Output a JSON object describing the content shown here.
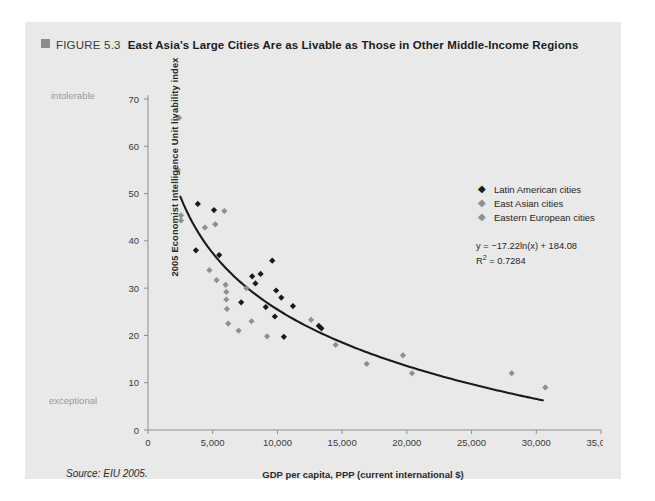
{
  "figure": {
    "marker_color": "#8d8d8d",
    "label": "FIGURE 5.3",
    "title": "East Asia's Large Cities Are as Livable as Those in Other Middle-Income Regions",
    "source": "Source: EIU 2005."
  },
  "legend": {
    "items": [
      {
        "label": "Latin American cities",
        "marker": "◆",
        "color": "#1a1a1a"
      },
      {
        "label": "East Asian cities",
        "marker": "◆",
        "color": "#8f8f8f"
      },
      {
        "label": "Eastern European cities",
        "marker": "◆",
        "color": "#8f8f8f"
      }
    ]
  },
  "annotations": {
    "equation": "y = −17.22ln(x) + 184.08",
    "r_squared_prefix": "R",
    "r_squared_exp": "2",
    "r_squared_value": " = 0.7284",
    "y_top_note": "intolerable",
    "y_bottom_note": "exceptional"
  },
  "chart_data": {
    "type": "scatter",
    "title": "East Asia's Large Cities Are as Livable as Those in Other Middle-Income Regions",
    "xlabel": "GDP per capita, PPP (current international $)",
    "ylabel": "2005 Economist Intelligence Unit livability index",
    "xlim": [
      0,
      35000
    ],
    "ylim": [
      0,
      70
    ],
    "xticks": [
      0,
      5000,
      10000,
      15000,
      20000,
      25000,
      30000,
      35000
    ],
    "xticklabels": [
      "0",
      "5,000",
      "10,000",
      "15,000",
      "20,000",
      "25,000",
      "30,000",
      "35,000"
    ],
    "yticks": [
      0,
      10,
      20,
      30,
      40,
      50,
      60,
      70
    ],
    "yticklabels": [
      "0",
      "10",
      "20",
      "30",
      "40",
      "50",
      "60",
      "70"
    ],
    "grid": false,
    "legend_position": "upper right inside",
    "series": [
      {
        "name": "Latin American cities",
        "color": "#1a1a1a",
        "marker": "diamond",
        "points": [
          [
            3850,
            47.8
          ],
          [
            3700,
            38.0
          ],
          [
            5100,
            46.5
          ],
          [
            5500,
            37.0
          ],
          [
            7200,
            27.0
          ],
          [
            8050,
            32.5
          ],
          [
            8300,
            31.0
          ],
          [
            8700,
            33.0
          ],
          [
            9600,
            35.8
          ],
          [
            9100,
            26.0
          ],
          [
            9800,
            24.0
          ],
          [
            9900,
            29.5
          ],
          [
            10300,
            28.0
          ],
          [
            10500,
            19.7
          ],
          [
            11200,
            26.2
          ],
          [
            13200,
            22.0
          ],
          [
            13400,
            21.5
          ]
        ]
      },
      {
        "name": "East Asian cities",
        "color": "#8f8f8f",
        "marker": "diamond",
        "points": [
          [
            2400,
            66.0
          ],
          [
            2300,
            55.0
          ],
          [
            2550,
            45.4
          ],
          [
            2550,
            44.3
          ],
          [
            4400,
            42.8
          ],
          [
            5900,
            46.3
          ],
          [
            4750,
            33.8
          ],
          [
            5300,
            31.7
          ],
          [
            6000,
            30.7
          ],
          [
            6050,
            29.2
          ],
          [
            6050,
            27.6
          ],
          [
            6100,
            25.6
          ],
          [
            7600,
            30.0
          ],
          [
            8000,
            23.0
          ],
          [
            9200,
            19.8
          ],
          [
            12600,
            23.3
          ],
          [
            16900,
            14.0
          ],
          [
            19700,
            15.8
          ],
          [
            20400,
            12.0
          ],
          [
            30700,
            9.0
          ],
          [
            28100,
            12.0
          ]
        ]
      },
      {
        "name": "Eastern European cities",
        "color": "#8f8f8f",
        "marker": "diamond",
        "points": [
          [
            5200,
            43.5
          ],
          [
            6200,
            22.5
          ],
          [
            7000,
            21.0
          ],
          [
            14500,
            18.0
          ]
        ]
      }
    ],
    "trendline": {
      "equation": "y = -17.22*ln(x) + 184.08",
      "r_squared": 0.7284,
      "x_start": 2500,
      "x_end": 30500,
      "color": "#1a1a1a"
    }
  }
}
